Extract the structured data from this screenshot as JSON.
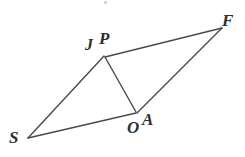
{
  "figure": {
    "kind": "geometry-diagram",
    "canvas": {
      "width": 245,
      "height": 157
    },
    "background_color": "#ffffff",
    "stroke_color": "#4a4a4a",
    "stroke_width": 1.4,
    "label_color": "#2e2e2e",
    "points": [
      {
        "id": "S",
        "label": "S",
        "x": 28,
        "y": 138
      },
      {
        "id": "J",
        "label": "J",
        "x": 104,
        "y": 56
      },
      {
        "id": "P",
        "label": "P",
        "x": 106,
        "y": 57
      },
      {
        "id": "F",
        "label": "F",
        "x": 222,
        "y": 28
      },
      {
        "id": "O",
        "label": "O",
        "x": 136,
        "y": 113
      },
      {
        "id": "A",
        "label": "A",
        "x": 138,
        "y": 112
      }
    ],
    "segments": [
      {
        "id": "S-J",
        "from": "S",
        "to": "J",
        "x1": 28,
        "y1": 138,
        "x2": 104,
        "y2": 56
      },
      {
        "id": "P-F",
        "from": "P",
        "to": "F",
        "x1": 105,
        "y1": 57,
        "x2": 222,
        "y2": 28
      },
      {
        "id": "F-A",
        "from": "F",
        "to": "A",
        "x1": 222,
        "y1": 28,
        "x2": 137,
        "y2": 113
      },
      {
        "id": "O-S",
        "from": "O",
        "to": "S",
        "x1": 136,
        "y1": 113,
        "x2": 28,
        "y2": 138
      },
      {
        "id": "J-O",
        "from": "J",
        "to": "O",
        "x1": 105,
        "y1": 57,
        "x2": 136,
        "y2": 112
      }
    ],
    "labels": {
      "S": "S",
      "J": "J",
      "P": "P",
      "F": "F",
      "O": "O",
      "A": "A"
    }
  }
}
